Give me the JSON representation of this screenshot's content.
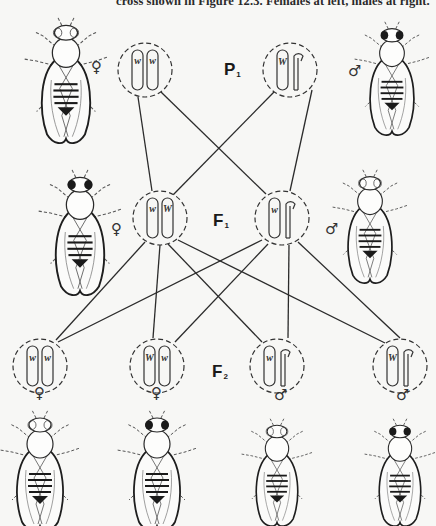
{
  "caption": "cross shown in Figure 12.3. Females at left, males at right.",
  "generations": {
    "p1": {
      "label": "P",
      "sub": "1"
    },
    "f1": {
      "label": "F",
      "sub": "1"
    },
    "f2": {
      "label": "F",
      "sub": "2"
    }
  },
  "symbols": {
    "female": "♀",
    "male": "♂"
  },
  "genotypes": {
    "p1_female": {
      "sex": "female",
      "chromosomes": [
        "X",
        "X"
      ],
      "alleles": [
        "w",
        "w"
      ],
      "eye": "white"
    },
    "p1_male": {
      "sex": "male",
      "chromosomes": [
        "X",
        "Y"
      ],
      "alleles": [
        "W",
        ""
      ],
      "eye": "red"
    },
    "f1_female": {
      "sex": "female",
      "chromosomes": [
        "X",
        "X"
      ],
      "alleles": [
        "w",
        "W"
      ],
      "eye": "red"
    },
    "f1_male": {
      "sex": "male",
      "chromosomes": [
        "X",
        "Y"
      ],
      "alleles": [
        "w",
        ""
      ],
      "eye": "white"
    },
    "f2_1": {
      "sex": "female",
      "chromosomes": [
        "X",
        "X"
      ],
      "alleles": [
        "w",
        "w"
      ],
      "eye": "white"
    },
    "f2_2": {
      "sex": "female",
      "chromosomes": [
        "X",
        "X"
      ],
      "alleles": [
        "W",
        "w"
      ],
      "eye": "red"
    },
    "f2_3": {
      "sex": "male",
      "chromosomes": [
        "X",
        "Y"
      ],
      "alleles": [
        "w",
        ""
      ],
      "eye": "white"
    },
    "f2_4": {
      "sex": "male",
      "chromosomes": [
        "X",
        "Y"
      ],
      "alleles": [
        "W",
        ""
      ],
      "eye": "red"
    }
  },
  "colors": {
    "ink": "#2b2b2b",
    "paper": "#f7f7f5",
    "dash": "#444444"
  }
}
